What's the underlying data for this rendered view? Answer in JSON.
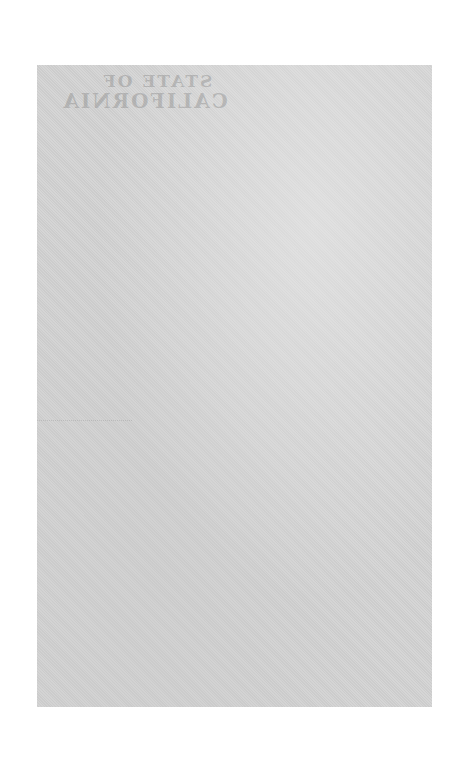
{
  "document": {
    "type": "scanned blank page",
    "bleed_through_text": {
      "line1": "STATE OF",
      "line2": "CALIFORNIA"
    },
    "colors": {
      "page": "#d3d3d3",
      "background": "#ffffff"
    }
  }
}
